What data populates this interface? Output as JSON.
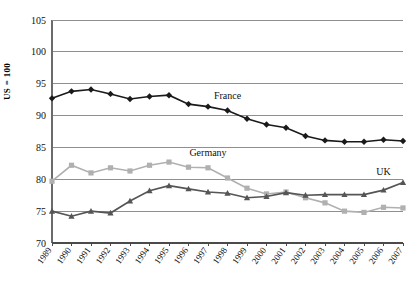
{
  "chart_data": {
    "type": "line",
    "title": "",
    "xlabel": "",
    "ylabel": "US = 100",
    "ylim": [
      70,
      105
    ],
    "yticks": [
      70,
      75,
      80,
      85,
      90,
      95,
      100,
      105
    ],
    "grid": true,
    "legend_position": "inline-annotations",
    "categories": [
      "1989",
      "1990",
      "1991",
      "1992",
      "1993",
      "1994",
      "1995",
      "1996",
      "1997",
      "1998",
      "1999",
      "2000",
      "2001",
      "2002",
      "2003",
      "2004",
      "2005",
      "2006",
      "2007"
    ],
    "series": [
      {
        "name": "France",
        "color": "#1a1a1a",
        "marker": "diamond",
        "values": [
          92.7,
          93.8,
          94.1,
          93.4,
          92.6,
          93.0,
          93.2,
          91.8,
          91.4,
          90.8,
          89.5,
          88.6,
          88.1,
          86.8,
          86.1,
          85.9,
          85.9,
          86.2,
          86.0
        ]
      },
      {
        "name": "Germany",
        "color": "#b0b0b0",
        "marker": "square",
        "values": [
          79.7,
          82.2,
          81.0,
          81.8,
          81.3,
          82.2,
          82.7,
          81.9,
          81.8,
          80.2,
          78.6,
          77.7,
          78.0,
          77.1,
          76.3,
          75.0,
          74.8,
          75.6,
          75.5
        ]
      },
      {
        "name": "UK",
        "color": "#555555",
        "marker": "triangle",
        "values": [
          75.0,
          74.2,
          75.0,
          74.7,
          76.6,
          78.2,
          79.0,
          78.5,
          78.0,
          77.8,
          77.1,
          77.3,
          77.9,
          77.5,
          77.6,
          77.6,
          77.6,
          78.3,
          79.5
        ]
      }
    ],
    "annotations": [
      {
        "text": "France",
        "x_year": "1998",
        "y_value": 92.6
      },
      {
        "text": "Germany",
        "x_year": "1997",
        "y_value": 83.6
      },
      {
        "text": "UK",
        "x_year": "2006",
        "y_value": 80.6
      }
    ]
  }
}
